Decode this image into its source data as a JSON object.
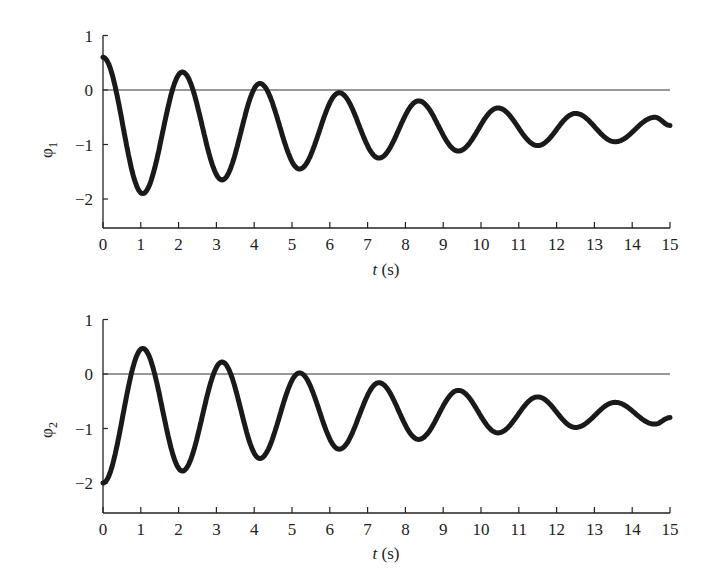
{
  "chart_data": [
    {
      "type": "line",
      "title": "",
      "xlabel": "t (s)",
      "ylabel": "φ1",
      "xlim": [
        0,
        15
      ],
      "ylim": [
        -2.5,
        1
      ],
      "xticks": [
        0,
        1,
        2,
        3,
        4,
        5,
        6,
        7,
        8,
        9,
        10,
        11,
        12,
        13,
        14,
        15
      ],
      "yticks": [
        1,
        0,
        -1,
        -2
      ],
      "ytick_labels": [
        "1",
        "0",
        "−1",
        "−2"
      ],
      "grid": false,
      "reference_line_y": 0,
      "series": [
        {
          "name": "φ1",
          "marker": "dot",
          "extrema": [
            [
              0,
              0.6
            ],
            [
              1.05,
              -1.9
            ],
            [
              2.1,
              0.33
            ],
            [
              3.15,
              -1.65
            ],
            [
              4.15,
              0.12
            ],
            [
              5.2,
              -1.45
            ],
            [
              6.25,
              -0.05
            ],
            [
              7.3,
              -1.25
            ],
            [
              8.35,
              -0.2
            ],
            [
              9.4,
              -1.12
            ],
            [
              10.45,
              -0.33
            ],
            [
              11.5,
              -1.02
            ],
            [
              12.5,
              -0.43
            ],
            [
              13.55,
              -0.95
            ],
            [
              14.6,
              -0.5
            ],
            [
              15,
              -0.65
            ]
          ]
        }
      ]
    },
    {
      "type": "line",
      "title": "",
      "xlabel": "t (s)",
      "ylabel": "φ2",
      "xlim": [
        0,
        15
      ],
      "ylim": [
        -2.5,
        1
      ],
      "xticks": [
        0,
        1,
        2,
        3,
        4,
        5,
        6,
        7,
        8,
        9,
        10,
        11,
        12,
        13,
        14,
        15
      ],
      "yticks": [
        1,
        0,
        -1,
        -2
      ],
      "ytick_labels": [
        "1",
        "0",
        "−1",
        "−2"
      ],
      "grid": false,
      "reference_line_y": 0,
      "series": [
        {
          "name": "φ2",
          "marker": "dot",
          "extrema": [
            [
              0,
              -2.0
            ],
            [
              1.05,
              0.47
            ],
            [
              2.1,
              -1.78
            ],
            [
              3.15,
              0.22
            ],
            [
              4.15,
              -1.55
            ],
            [
              5.2,
              0.02
            ],
            [
              6.25,
              -1.38
            ],
            [
              7.3,
              -0.16
            ],
            [
              8.35,
              -1.2
            ],
            [
              9.4,
              -0.3
            ],
            [
              10.45,
              -1.08
            ],
            [
              11.5,
              -0.42
            ],
            [
              12.5,
              -0.98
            ],
            [
              13.55,
              -0.52
            ],
            [
              14.6,
              -0.92
            ],
            [
              15,
              -0.8
            ]
          ]
        }
      ]
    }
  ],
  "plots": [
    {
      "ylabel_main": "φ",
      "ylabel_sub": "1",
      "xlabel_var": "t",
      "xlabel_unit": " (s)"
    },
    {
      "ylabel_main": "φ",
      "ylabel_sub": "2",
      "xlabel_var": "t",
      "xlabel_unit": " (s)"
    }
  ]
}
